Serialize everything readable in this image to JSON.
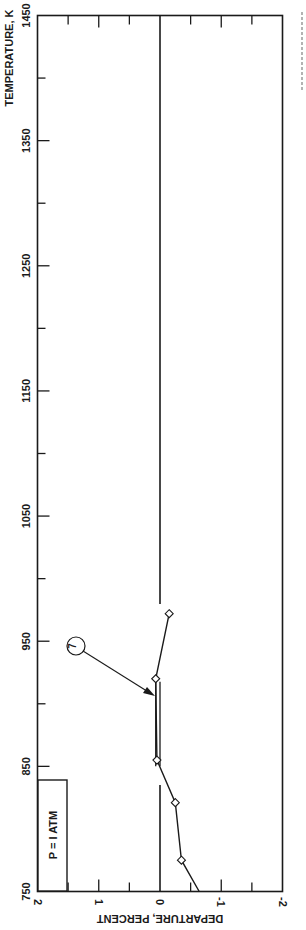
{
  "chart_data": {
    "type": "line",
    "orientation": "rotated 90deg (temperature axis vertical on left, departure axis horizontal along bottom, text rotated)",
    "title": "",
    "xlabel": "TEMPERATURE, K",
    "ylabel": "DEPARTURE, PERCENT",
    "xlim": [
      750,
      1450
    ],
    "ylim": [
      -2,
      2
    ],
    "x_ticks": [
      "750",
      "850",
      "950",
      "1050",
      "1150",
      "1250",
      "1350",
      "1450"
    ],
    "x_tick_values": [
      750,
      850,
      950,
      1050,
      1150,
      1250,
      1350,
      1450
    ],
    "y_ticks": [
      "2",
      "1",
      "0",
      "-1",
      "-2"
    ],
    "y_tick_values": [
      2,
      1,
      0,
      -1,
      -2
    ],
    "grid": false,
    "zero_line": true,
    "legend_box": "P = 1 ATM",
    "series": [
      {
        "name": "7",
        "marker": "diamond-open",
        "x": [
          750,
          775,
          821,
          855,
          920,
          972
        ],
        "values": [
          -0.64,
          -0.35,
          -0.25,
          0.05,
          0.07,
          -0.15
        ],
        "marker_points_x": [
          775,
          821,
          855,
          920,
          972
        ]
      },
      {
        "name": "7 (range bar)",
        "type": "double-line",
        "x": [
          862,
          920
        ],
        "values": [
          0.0,
          0.0
        ]
      }
    ],
    "annotations": [
      {
        "text": "7",
        "type": "circled-label-with-arrow",
        "points_to": {
          "x": 895,
          "y": 0.05
        }
      }
    ]
  },
  "labels": {
    "x_axis_title": "TEMPERATURE, K",
    "y_axis_title": "DEPARTURE, PERCENT",
    "legend": "P = I ATM",
    "curve_id": "7",
    "t_ticks": [
      "750",
      "850",
      "950",
      "1050",
      "1150",
      "1250",
      "1350",
      "1450"
    ],
    "d_ticks": [
      "2",
      "1",
      "0",
      "-1",
      "-2"
    ]
  }
}
